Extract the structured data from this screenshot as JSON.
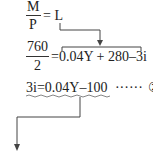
{
  "equation1": {
    "numerator": "M",
    "denominator": "P",
    "rhs": "= L"
  },
  "equation2": {
    "numerator": "760",
    "denominator": "2",
    "rhs": "=0.04Y + 280–3i"
  },
  "equation3": {
    "text": "3i=0.04Y–100",
    "dots": "······",
    "marker": "②"
  }
}
